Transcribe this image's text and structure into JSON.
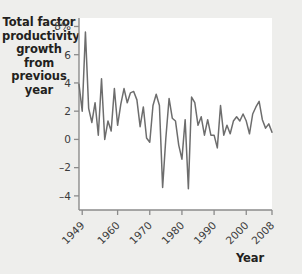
{
  "chart_data": {
    "type": "line",
    "title": "",
    "ylabel": "Total factor productivity growth from previous year",
    "xlabel": "Year",
    "grid": false,
    "legend": null,
    "ylim": [
      -5,
      8.6
    ],
    "xlim": [
      1948,
      2008
    ],
    "ytick_labels": [
      "8%",
      "6",
      "4",
      "2",
      "0",
      "-2",
      "-4"
    ],
    "ytick_values": [
      8,
      6,
      4,
      2,
      0,
      -2,
      -4
    ],
    "xtick_labels": [
      "1949",
      "1960",
      "1970",
      "1980",
      "1990",
      "2000",
      "2008"
    ],
    "xtick_values": [
      1949,
      1960,
      1970,
      1980,
      1990,
      2000,
      2008
    ],
    "line_color": "#6d6d6d",
    "x": [
      1948,
      1949,
      1950,
      1951,
      1952,
      1953,
      1954,
      1955,
      1956,
      1957,
      1958,
      1959,
      1960,
      1961,
      1962,
      1963,
      1964,
      1965,
      1966,
      1967,
      1968,
      1969,
      1970,
      1971,
      1972,
      1973,
      1974,
      1975,
      1976,
      1977,
      1978,
      1979,
      1980,
      1981,
      1982,
      1983,
      1984,
      1985,
      1986,
      1987,
      1988,
      1989,
      1990,
      1991,
      1992,
      1993,
      1994,
      1995,
      1996,
      1997,
      1998,
      1999,
      2000,
      2001,
      2002,
      2003,
      2004,
      2005,
      2006,
      2007,
      2008
    ],
    "values": [
      3.9,
      2.0,
      7.6,
      2.2,
      1.2,
      2.6,
      0.3,
      4.3,
      0.0,
      1.3,
      0.6,
      3.6,
      1.0,
      2.5,
      3.6,
      2.6,
      3.3,
      3.4,
      2.8,
      0.9,
      2.3,
      0.1,
      -0.2,
      2.4,
      3.2,
      2.4,
      -3.4,
      0.1,
      2.9,
      1.5,
      1.3,
      -0.4,
      -1.4,
      1.4,
      -3.5,
      3.0,
      2.6,
      1.0,
      1.6,
      0.3,
      1.4,
      0.3,
      0.3,
      -0.6,
      2.4,
      0.3,
      1.0,
      0.4,
      1.3,
      1.6,
      1.3,
      1.8,
      1.3,
      0.4,
      1.8,
      2.3,
      2.7,
      1.4,
      0.8,
      1.1,
      0.5
    ]
  },
  "axis_titles": {
    "y": "Total factor productivity growth from previous year",
    "x": "Year"
  }
}
